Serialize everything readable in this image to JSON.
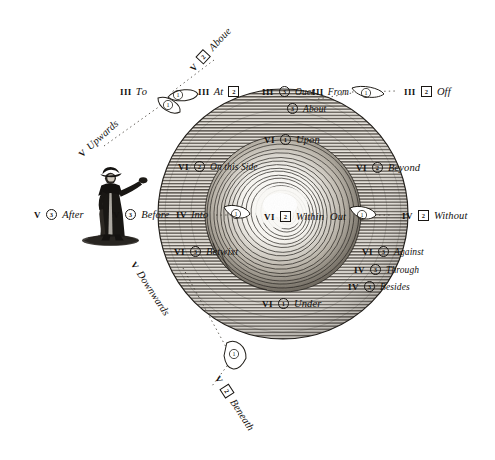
{
  "plate": {
    "title": "Diagram of Prepositions of Place",
    "background_color": "#ffffff",
    "ink_color": "#141210",
    "sphere": {
      "label": "hatched globe with central vortex",
      "fill": "#cfcac2",
      "center_x": 283,
      "center_y": 214,
      "radius": 125
    },
    "figure": {
      "label": "standing man in long coat and hat pointing right",
      "x": 110,
      "y": 212
    }
  },
  "labels": [
    {
      "id": "above",
      "roman": "V",
      "num": "2",
      "style": "box",
      "word": "Aboue",
      "x": 196,
      "y": 66,
      "rot": -47
    },
    {
      "id": "upwards",
      "roman": "V",
      "num": "1",
      "style": "circle",
      "word": "Upwards",
      "x": 84,
      "y": 152,
      "rot": -42,
      "order": "word-first"
    },
    {
      "id": "to",
      "roman": "III",
      "num": "1",
      "style": "circle",
      "word": "Tο",
      "x": 120,
      "y": 90,
      "rot": 0,
      "order": "word-first"
    },
    {
      "id": "at",
      "roman": "III",
      "num": "2",
      "style": "box",
      "word": "At",
      "x": 198,
      "y": 90,
      "rot": 0,
      "order": "word-first"
    },
    {
      "id": "over",
      "roman": "III",
      "num": "3",
      "style": "circle",
      "word": "Ouer",
      "x": 262,
      "y": 90,
      "rot": 0
    },
    {
      "id": "about",
      "roman": "",
      "num": "3",
      "style": "circle",
      "word": "About",
      "x": 286,
      "y": 107,
      "rot": 0
    },
    {
      "id": "from",
      "roman": "III",
      "num": "1",
      "style": "circle",
      "word": "From",
      "x": 312,
      "y": 90,
      "rot": 0,
      "order": "word-first"
    },
    {
      "id": "off",
      "roman": "III",
      "num": "2",
      "style": "box",
      "word": "Off",
      "x": 404,
      "y": 90,
      "rot": 0
    },
    {
      "id": "upon",
      "roman": "VI",
      "num": "1",
      "style": "circle",
      "word": "Upon",
      "x": 264,
      "y": 138,
      "rot": 0
    },
    {
      "id": "onthisside",
      "roman": "VI",
      "num": "2",
      "style": "circle",
      "word": "On this Side",
      "x": 178,
      "y": 165,
      "rot": 0
    },
    {
      "id": "beyond",
      "roman": "VI",
      "num": "2",
      "style": "circle",
      "word": "Beyond",
      "x": 356,
      "y": 166,
      "rot": 0
    },
    {
      "id": "after",
      "roman": "V",
      "num": "3",
      "style": "circle",
      "word": "After",
      "x": 34,
      "y": 213,
      "rot": 0
    },
    {
      "id": "before",
      "roman": "V",
      "num": "3",
      "style": "circle",
      "word": "Before",
      "x": 113,
      "y": 213,
      "rot": 0
    },
    {
      "id": "into",
      "roman": "IV",
      "num": "1",
      "style": "circle",
      "word": "Into",
      "x": 176,
      "y": 213,
      "rot": 0,
      "order": "word-first"
    },
    {
      "id": "within",
      "roman": "VI",
      "num": "2",
      "style": "box",
      "word": "Within",
      "x": 264,
      "y": 215,
      "rot": 0
    },
    {
      "id": "out",
      "roman": "",
      "num": "1",
      "style": "circle",
      "word": "Out",
      "x": 330,
      "y": 215,
      "rot": 0,
      "order": "word-first"
    },
    {
      "id": "without",
      "roman": "IV",
      "num": "2",
      "style": "box",
      "word": "Without",
      "x": 402,
      "y": 214,
      "rot": 0
    },
    {
      "id": "betwixt",
      "roman": "VI",
      "num": "3",
      "style": "circle",
      "word": "Betwixt",
      "x": 174,
      "y": 250,
      "rot": 0
    },
    {
      "id": "against",
      "roman": "VI",
      "num": "3",
      "style": "circle",
      "word": "Against",
      "x": 362,
      "y": 250,
      "rot": 0
    },
    {
      "id": "through",
      "roman": "IV",
      "num": "3",
      "style": "circle",
      "word": "Through",
      "x": 354,
      "y": 268,
      "rot": 0
    },
    {
      "id": "besides",
      "roman": "IV",
      "num": "3",
      "style": "circle",
      "word": "Besides",
      "x": 348,
      "y": 285,
      "rot": 0
    },
    {
      "id": "under",
      "roman": "VI",
      "num": "1",
      "style": "circle",
      "word": "Under",
      "x": 262,
      "y": 302,
      "rot": 0
    },
    {
      "id": "downwards",
      "roman": "V",
      "num": "1",
      "style": "circle",
      "word": "Downwards",
      "x": 128,
      "y": 258,
      "rot": 57,
      "order": "word-first"
    },
    {
      "id": "beneath",
      "roman": "V",
      "num": "2",
      "style": "box",
      "word": "Beneath",
      "x": 212,
      "y": 372,
      "rot": 57
    }
  ],
  "pointers": [
    {
      "id": "pointer-to",
      "label": "teardrop pointer toward To"
    },
    {
      "id": "pointer-upwards",
      "label": "teardrop pointer toward Upwards"
    },
    {
      "id": "pointer-from",
      "label": "teardrop pointer toward From"
    },
    {
      "id": "pointer-into",
      "label": "teardrop pointer toward Into"
    },
    {
      "id": "pointer-out",
      "label": "teardrop pointer toward Out"
    },
    {
      "id": "pointer-downwards",
      "label": "teardrop pointer toward Downwards"
    }
  ]
}
